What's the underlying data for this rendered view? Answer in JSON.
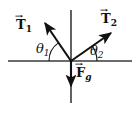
{
  "figure": {
    "background_color": "#ffffff",
    "stroke_color": "#111111",
    "axis_color": "#3a3a3a"
  },
  "axes": {
    "origin": {
      "x": 71,
      "y": 61
    },
    "horizontal": {
      "x1": 8,
      "y1": 61,
      "x2": 132,
      "y2": 61
    },
    "vertical": {
      "x1": 71,
      "y1": 10,
      "x2": 71,
      "y2": 103
    }
  },
  "vectors": [
    {
      "id": "T1",
      "label_base": "T",
      "label_subscript": "1",
      "has_vector_arrow": true,
      "direction": "up-left",
      "tip": {
        "x": 43,
        "y": 21
      },
      "angle_from_horizontal_deg": 55
    },
    {
      "id": "T2",
      "label_base": "T",
      "label_subscript": "2",
      "has_vector_arrow": true,
      "direction": "up-right",
      "tip": {
        "x": 113,
        "y": 32
      },
      "angle_from_horizontal_deg": 35
    },
    {
      "id": "Fg",
      "label_base": "F",
      "label_subscript": "g",
      "has_vector_arrow": true,
      "direction": "down",
      "tip": {
        "x": 71,
        "y": 89
      },
      "angle_from_horizontal_deg": -90
    }
  ],
  "angles": [
    {
      "id": "theta1",
      "symbol": "θ",
      "subscript": "1",
      "between": "T1 and negative-x-axis",
      "arc_radius": 22
    },
    {
      "id": "theta2",
      "symbol": "θ",
      "subscript": "2",
      "between": "T2 and positive-x-axis",
      "arc_radius": 26
    }
  ]
}
